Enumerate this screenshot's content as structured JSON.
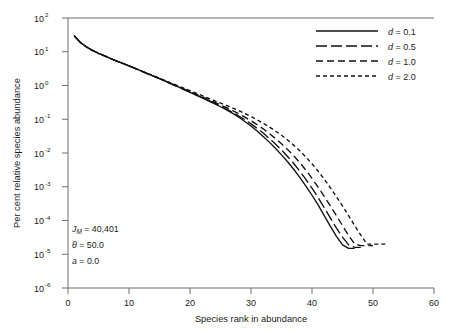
{
  "chart_data": {
    "type": "line",
    "title": "",
    "xlabel": "Species rank in abundance",
    "ylabel": "Per cent relative species abundance",
    "xlim": [
      0,
      60
    ],
    "ylim": [
      1e-06,
      100
    ],
    "yscale": "log",
    "xticks": [
      0,
      10,
      20,
      30,
      40,
      50,
      60
    ],
    "xtick_labels": [
      "0",
      "10",
      "20",
      "30",
      "40",
      "50",
      "60"
    ],
    "yticks": [
      100,
      10,
      1,
      0.1,
      0.01,
      0.001,
      0.0001,
      1e-05,
      1e-06
    ],
    "ytick_labels": [
      "10",
      "10",
      "10",
      "10",
      "10",
      "10",
      "10",
      "10",
      "10"
    ],
    "ytick_exponents": [
      "2",
      "1",
      "0",
      "-1",
      "-2",
      "-3",
      "-4",
      "-5",
      "-6"
    ],
    "grid": false,
    "legend_position": "top-right",
    "legend_entries": [
      {
        "label_prefix": "d",
        "label_suffix": " = 0.1",
        "dash": "solid"
      },
      {
        "label_prefix": "d",
        "label_suffix": " = 0.5",
        "dash": "long-dash"
      },
      {
        "label_prefix": "d",
        "label_suffix": " = 1.0",
        "dash": "medium-dash"
      },
      {
        "label_prefix": "d",
        "label_suffix": " = 2.0",
        "dash": "short-dash"
      }
    ],
    "annotations": [
      {
        "symbol": "J",
        "subscript": "M",
        "text": " = 40,401"
      },
      {
        "symbol": "θ",
        "subscript": "",
        "text": " = 50.0"
      },
      {
        "symbol": "a",
        "subscript": "",
        "text": " = 0.0"
      }
    ],
    "series": [
      {
        "name": "d = 0.1",
        "dash": "solid",
        "x": [
          1,
          2,
          3,
          4,
          5,
          6,
          7,
          8,
          9,
          10,
          11,
          12,
          13,
          14,
          15,
          16,
          17,
          18,
          19,
          20,
          21,
          22,
          23,
          24,
          25,
          26,
          27,
          28,
          29,
          30,
          31,
          32,
          33,
          34,
          35,
          36,
          37,
          38,
          39,
          40,
          41,
          42,
          43,
          44,
          45,
          46,
          47
        ],
        "y": [
          30.0,
          19.0,
          14.0,
          11.0,
          9.0,
          7.5,
          6.3,
          5.3,
          4.5,
          3.8,
          3.2,
          2.7,
          2.25,
          1.9,
          1.6,
          1.33,
          1.1,
          0.92,
          0.76,
          0.63,
          0.52,
          0.43,
          0.35,
          0.29,
          0.235,
          0.19,
          0.15,
          0.115,
          0.086,
          0.063,
          0.045,
          0.031,
          0.021,
          0.0138,
          0.0088,
          0.0055,
          0.0033,
          0.0019,
          0.00105,
          0.00056,
          0.00029,
          0.00014,
          6.8e-05,
          3.4e-05,
          1.9e-05,
          1.5e-05,
          1.5e-05
        ]
      },
      {
        "name": "d = 0.5",
        "dash": "long-dash",
        "x": [
          1,
          2,
          3,
          4,
          5,
          6,
          7,
          8,
          9,
          10,
          11,
          12,
          13,
          14,
          15,
          16,
          17,
          18,
          19,
          20,
          21,
          22,
          23,
          24,
          25,
          26,
          27,
          28,
          29,
          30,
          31,
          32,
          33,
          34,
          35,
          36,
          37,
          38,
          39,
          40,
          41,
          42,
          43,
          44,
          45,
          46,
          47,
          48
        ],
        "y": [
          30.0,
          19.0,
          14.0,
          11.0,
          9.0,
          7.5,
          6.3,
          5.3,
          4.5,
          3.8,
          3.2,
          2.7,
          2.25,
          1.9,
          1.6,
          1.33,
          1.1,
          0.92,
          0.77,
          0.64,
          0.53,
          0.44,
          0.36,
          0.3,
          0.245,
          0.2,
          0.16,
          0.125,
          0.097,
          0.073,
          0.054,
          0.039,
          0.027,
          0.0185,
          0.0123,
          0.0079,
          0.0049,
          0.0029,
          0.00165,
          0.00091,
          0.00048,
          0.00024,
          0.00012,
          6e-05,
          3.2e-05,
          1.9e-05,
          1.6e-05,
          1.6e-05
        ]
      },
      {
        "name": "d = 1.0",
        "dash": "medium-dash",
        "x": [
          1,
          2,
          3,
          4,
          5,
          6,
          7,
          8,
          9,
          10,
          11,
          12,
          13,
          14,
          15,
          16,
          17,
          18,
          19,
          20,
          21,
          22,
          23,
          24,
          25,
          26,
          27,
          28,
          29,
          30,
          31,
          32,
          33,
          34,
          35,
          36,
          37,
          38,
          39,
          40,
          41,
          42,
          43,
          44,
          45,
          46,
          47,
          48,
          49,
          50
        ],
        "y": [
          30.0,
          19.0,
          14.0,
          11.0,
          9.0,
          7.5,
          6.3,
          5.3,
          4.5,
          3.8,
          3.2,
          2.7,
          2.25,
          1.9,
          1.6,
          1.35,
          1.12,
          0.94,
          0.79,
          0.66,
          0.55,
          0.46,
          0.385,
          0.32,
          0.265,
          0.22,
          0.18,
          0.145,
          0.115,
          0.09,
          0.069,
          0.052,
          0.038,
          0.027,
          0.0188,
          0.0127,
          0.0083,
          0.0052,
          0.0031,
          0.00178,
          0.00098,
          0.00052,
          0.00027,
          0.00014,
          7e-05,
          3.6e-05,
          2e-05,
          1.8e-05,
          1.8e-05,
          1.8e-05
        ]
      },
      {
        "name": "d = 2.0",
        "dash": "short-dash",
        "x": [
          1,
          2,
          3,
          4,
          5,
          6,
          7,
          8,
          9,
          10,
          11,
          12,
          13,
          14,
          15,
          16,
          17,
          18,
          19,
          20,
          21,
          22,
          23,
          24,
          25,
          26,
          27,
          28,
          29,
          30,
          31,
          32,
          33,
          34,
          35,
          36,
          37,
          38,
          39,
          40,
          41,
          42,
          43,
          44,
          45,
          46,
          47,
          48,
          49,
          50,
          51,
          52
        ],
        "y": [
          30.0,
          19.0,
          14.0,
          11.0,
          9.0,
          7.5,
          6.3,
          5.3,
          4.5,
          3.8,
          3.2,
          2.7,
          2.3,
          1.95,
          1.65,
          1.38,
          1.16,
          0.98,
          0.83,
          0.7,
          0.59,
          0.5,
          0.42,
          0.355,
          0.3,
          0.255,
          0.215,
          0.18,
          0.148,
          0.12,
          0.096,
          0.076,
          0.059,
          0.045,
          0.0335,
          0.0243,
          0.0171,
          0.0116,
          0.0076,
          0.0048,
          0.0029,
          0.00168,
          0.00094,
          0.00051,
          0.00027,
          0.00014,
          7e-05,
          3.7e-05,
          2e-05,
          2e-05,
          2e-05,
          2e-05
        ]
      }
    ]
  }
}
